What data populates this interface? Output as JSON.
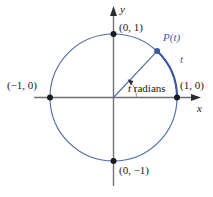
{
  "figure": {
    "colors": {
      "circle": "#4a6aa5",
      "arc_highlight": "#3a5a9c",
      "radius_line": "#4a6aa5",
      "axis": "#6f6f78",
      "point_fill": "#1a1a20",
      "label_black": "#17171c",
      "label_blue": "#3b5a9e"
    },
    "axes": {
      "x_label": "x",
      "y_label": "y"
    },
    "labels": {
      "top_point": "(0, 1)",
      "left_point": "(−1, 0)",
      "right_point": "(1, 0)",
      "bottom_point": "(0, −1)",
      "moving_point": "P(t)",
      "arc_length": "t",
      "angle": "t radians"
    }
  },
  "chart_data": {
    "type": "scatter",
    "xlabel": "x",
    "ylabel": "y",
    "xlim": [
      -1.55,
      1.35
    ],
    "ylim": [
      -1.35,
      1.3
    ],
    "grid": false,
    "legend": null,
    "annotations": [
      {
        "text": "(0, 1)",
        "x": 0,
        "y": 1,
        "position": "upper-right-of-point"
      },
      {
        "text": "(−1, 0)",
        "x": -1,
        "y": 0,
        "position": "left-of-point"
      },
      {
        "text": "(1, 0)",
        "x": 1,
        "y": 0,
        "position": "right-of-point"
      },
      {
        "text": "(0, −1)",
        "x": 0,
        "y": -1,
        "position": "lower-right-of-point"
      },
      {
        "text": "P(t)",
        "x": 0.71,
        "y": 0.77,
        "position": "upper-right-of-point",
        "color": "#3b5a9e"
      },
      {
        "text": "t",
        "x": 1.04,
        "y": 0.62,
        "position": "outside-arc",
        "color": "#3b5a9e"
      },
      {
        "text": "t radians",
        "x": 0.3,
        "y": 0.25,
        "position": "inside-angle"
      }
    ],
    "shapes": [
      {
        "kind": "circle",
        "cx": 0,
        "cy": 0,
        "r": 1,
        "stroke": "#4a6aa5",
        "fill": "none",
        "linewidth": 1
      },
      {
        "kind": "arc",
        "cx": 0,
        "cy": 0,
        "r": 1,
        "theta_start_deg": 0,
        "theta_end_deg": 47,
        "stroke": "#3a5a9c",
        "linewidth": 2
      },
      {
        "kind": "segment",
        "x1": 0,
        "y1": 0,
        "x2": 0.68,
        "y2": 0.73,
        "stroke": "#4a6aa5",
        "linewidth": 1
      },
      {
        "kind": "arc",
        "cx": 0,
        "cy": 0,
        "r": 0.36,
        "theta_start_deg": 0,
        "theta_end_deg": 47,
        "stroke": "#8a8a93",
        "linewidth": 0.8,
        "arrow_end": true
      }
    ],
    "points": [
      {
        "label": "(0, 1)",
        "x": 0,
        "y": 1,
        "marker": "o",
        "color": "#1a1a20"
      },
      {
        "label": "(−1, 0)",
        "x": -1,
        "y": 0,
        "marker": "o",
        "color": "#1a1a20"
      },
      {
        "label": "(1, 0)",
        "x": 1,
        "y": 0,
        "marker": "o",
        "color": "#1a1a20"
      },
      {
        "label": "(0, −1)",
        "x": 0,
        "y": -1,
        "marker": "o",
        "color": "#1a1a20"
      },
      {
        "label": "P(t)",
        "x": 0.68,
        "y": 0.73,
        "marker": "o",
        "color": "#3b5a9e"
      }
    ]
  }
}
